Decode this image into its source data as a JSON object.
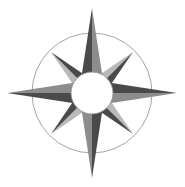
{
  "figure": {
    "name": "compass-rose",
    "width": 185,
    "height": 187,
    "background_color": "#ffffff"
  },
  "chart_data": {
    "type": "diagram",
    "subtype": "compass-rose",
    "center": {
      "x": 92,
      "y": 93
    },
    "ring": {
      "radius": 60,
      "stroke_color": "#9a9a9a",
      "stroke_width": 0.9,
      "fill": "none"
    },
    "hub": {
      "radius": 21,
      "fill_color": "#ffffff",
      "stroke_color": "#8f8f8f",
      "stroke_width": 0.8
    },
    "colors": {
      "dark_facet": "#4a4a4a",
      "mid_facet": "#8d8d8d",
      "light_facet": "#b9b9b9",
      "ring_stroke": "#9a9a9a",
      "background": "#ffffff"
    },
    "points": [
      {
        "label": "N",
        "angle_deg": 0,
        "type": "cardinal",
        "tip_radius": 85,
        "base_half_width": 13,
        "left_facet": "dark_facet",
        "right_facet": "mid_facet"
      },
      {
        "label": "NE",
        "angle_deg": 45,
        "type": "intercardinal",
        "tip_radius": 58,
        "base_half_width": 11,
        "left_facet": "light_facet",
        "right_facet": "dark_facet"
      },
      {
        "label": "E",
        "angle_deg": 90,
        "type": "cardinal",
        "tip_radius": 85,
        "base_half_width": 13,
        "left_facet": "dark_facet",
        "right_facet": "mid_facet"
      },
      {
        "label": "SE",
        "angle_deg": 135,
        "type": "intercardinal",
        "tip_radius": 58,
        "base_half_width": 11,
        "left_facet": "light_facet",
        "right_facet": "dark_facet"
      },
      {
        "label": "S",
        "angle_deg": 180,
        "type": "cardinal",
        "tip_radius": 85,
        "base_half_width": 13,
        "left_facet": "dark_facet",
        "right_facet": "mid_facet"
      },
      {
        "label": "SW",
        "angle_deg": 225,
        "type": "intercardinal",
        "tip_radius": 58,
        "base_half_width": 11,
        "left_facet": "light_facet",
        "right_facet": "dark_facet"
      },
      {
        "label": "W",
        "angle_deg": 270,
        "type": "cardinal",
        "tip_radius": 85,
        "base_half_width": 13,
        "left_facet": "dark_facet",
        "right_facet": "mid_facet"
      },
      {
        "label": "NW",
        "angle_deg": 315,
        "type": "intercardinal",
        "tip_radius": 58,
        "base_half_width": 11,
        "left_facet": "light_facet",
        "right_facet": "dark_facet"
      }
    ],
    "labels": [],
    "legend": [],
    "axes": null,
    "grid": false
  }
}
